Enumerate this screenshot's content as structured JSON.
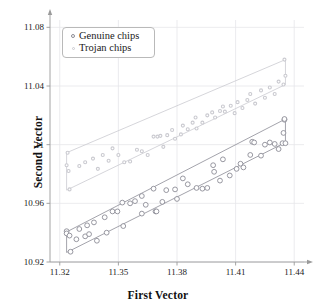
{
  "chart_data": {
    "type": "scatter",
    "title": "",
    "xlabel": "First Vector",
    "ylabel": "Second Vector",
    "xlim": [
      11.315,
      11.445
    ],
    "ylim": [
      10.92,
      11.085
    ],
    "xticks": [
      "11.32",
      "11.35",
      "11.38",
      "11.41",
      "11.44"
    ],
    "xtick_values": [
      11.32,
      11.35,
      11.38,
      11.41,
      11.44
    ],
    "yticks": [
      "10.92",
      "10.96",
      "11",
      "11.04",
      "11.08"
    ],
    "ytick_values": [
      10.92,
      10.96,
      11.0,
      11.04,
      11.08
    ],
    "grid": true,
    "legend_position": "upper-left",
    "colors": {
      "genuine": "#8c8c96",
      "trojan": "#cacad0",
      "grid": "#e6e6ea",
      "axis": "#9a9a9a",
      "text": "#1a1a1a"
    },
    "series": [
      {
        "name": "Genuine chips",
        "marker": "circle-open",
        "color": "#8c8c96",
        "hull": [
          [
            11.3235,
            10.9405
          ],
          [
            11.3235,
            10.9265
          ],
          [
            11.4355,
            11.0015
          ],
          [
            11.4355,
            11.0175
          ]
        ],
        "points": [
          [
            11.3235,
            10.941
          ],
          [
            11.3235,
            10.9395
          ],
          [
            11.325,
            10.938
          ],
          [
            11.3255,
            10.927
          ],
          [
            11.3285,
            10.9355
          ],
          [
            11.33,
            10.9425
          ],
          [
            11.333,
            10.9375
          ],
          [
            11.334,
            10.945
          ],
          [
            11.335,
            10.939
          ],
          [
            11.3375,
            10.947
          ],
          [
            11.339,
            10.9345
          ],
          [
            11.343,
            10.9505
          ],
          [
            11.344,
            10.94
          ],
          [
            11.347,
            10.9545
          ],
          [
            11.3495,
            10.9545
          ],
          [
            11.352,
            10.9605
          ],
          [
            11.3525,
            10.9445
          ],
          [
            11.356,
            10.96
          ],
          [
            11.3585,
            10.9615
          ],
          [
            11.362,
            10.965
          ],
          [
            11.362,
            10.953
          ],
          [
            11.364,
            10.959
          ],
          [
            11.368,
            10.97
          ],
          [
            11.369,
            10.9545
          ],
          [
            11.3695,
            10.9545
          ],
          [
            11.3725,
            10.961
          ],
          [
            11.3745,
            10.969
          ],
          [
            11.379,
            10.9695
          ],
          [
            11.38,
            10.963
          ],
          [
            11.383,
            10.977
          ],
          [
            11.3855,
            10.973
          ],
          [
            11.39,
            10.9705
          ],
          [
            11.393,
            10.97
          ],
          [
            11.3955,
            10.9705
          ],
          [
            11.3985,
            10.986
          ],
          [
            11.399,
            10.9815
          ],
          [
            11.402,
            10.9755
          ],
          [
            11.4035,
            10.99
          ],
          [
            11.407,
            10.979
          ],
          [
            11.4105,
            10.9835
          ],
          [
            11.4125,
            10.987
          ],
          [
            11.414,
            10.9845
          ],
          [
            11.4175,
            10.993
          ],
          [
            11.4185,
            11.002
          ],
          [
            11.4195,
            11.0015
          ],
          [
            11.423,
            10.9925
          ],
          [
            11.425,
            11.0
          ],
          [
            11.4275,
            11.0015
          ],
          [
            11.43,
            11.0005
          ],
          [
            11.432,
            10.997
          ],
          [
            11.434,
            11.001
          ],
          [
            11.4345,
            11.008
          ],
          [
            11.435,
            11.017
          ],
          [
            11.435,
            11.0175
          ],
          [
            11.4355,
            11.001
          ]
        ]
      },
      {
        "name": "Trojan chips",
        "marker": "dot-small",
        "color": "#cacad0",
        "hull": [
          [
            11.3235,
            10.9945
          ],
          [
            11.3235,
            10.969
          ],
          [
            11.4355,
            11.041
          ],
          [
            11.4355,
            11.058
          ]
        ],
        "points": [
          [
            11.3235,
            10.986
          ],
          [
            11.324,
            10.9945
          ],
          [
            11.3245,
            10.982
          ],
          [
            11.325,
            10.9695
          ],
          [
            11.33,
            10.9855
          ],
          [
            11.333,
            10.988
          ],
          [
            11.337,
            10.9905
          ],
          [
            11.3395,
            10.9835
          ],
          [
            11.342,
            10.993
          ],
          [
            11.345,
            10.989
          ],
          [
            11.347,
            10.9975
          ],
          [
            11.35,
            10.993
          ],
          [
            11.353,
            10.988
          ],
          [
            11.356,
            10.9885
          ],
          [
            11.3595,
            10.9965
          ],
          [
            11.362,
            10.9955
          ],
          [
            11.365,
            10.993
          ],
          [
            11.368,
            11.0055
          ],
          [
            11.37,
            11.0055
          ],
          [
            11.3715,
            11.006
          ],
          [
            11.373,
            10.9985
          ],
          [
            11.375,
            11.0065
          ],
          [
            11.3775,
            11.01
          ],
          [
            11.379,
            11.004
          ],
          [
            11.382,
            11.007
          ],
          [
            11.383,
            11.013
          ],
          [
            11.3855,
            11.0105
          ],
          [
            11.388,
            11.015
          ],
          [
            11.3895,
            11.0185
          ],
          [
            11.39,
            11.011
          ],
          [
            11.393,
            11.015
          ],
          [
            11.3955,
            11.02
          ],
          [
            11.398,
            11.022
          ],
          [
            11.3995,
            11.0185
          ],
          [
            11.402,
            11.023
          ],
          [
            11.4035,
            11.026
          ],
          [
            11.4045,
            11.0225
          ],
          [
            11.4075,
            11.0265
          ],
          [
            11.4095,
            11.0215
          ],
          [
            11.411,
            11.029
          ],
          [
            11.4135,
            11.025
          ],
          [
            11.416,
            11.0305
          ],
          [
            11.4175,
            11.0345
          ],
          [
            11.42,
            11.028
          ],
          [
            11.423,
            11.037
          ],
          [
            11.425,
            11.032
          ],
          [
            11.4275,
            11.039
          ],
          [
            11.43,
            11.0345
          ],
          [
            11.432,
            11.043
          ],
          [
            11.4345,
            11.041
          ],
          [
            11.435,
            11.058
          ],
          [
            11.4355,
            11.047
          ]
        ]
      }
    ]
  },
  "legend": {
    "items": [
      {
        "label": "Genuine chips"
      },
      {
        "label": "Trojan chips"
      }
    ]
  }
}
